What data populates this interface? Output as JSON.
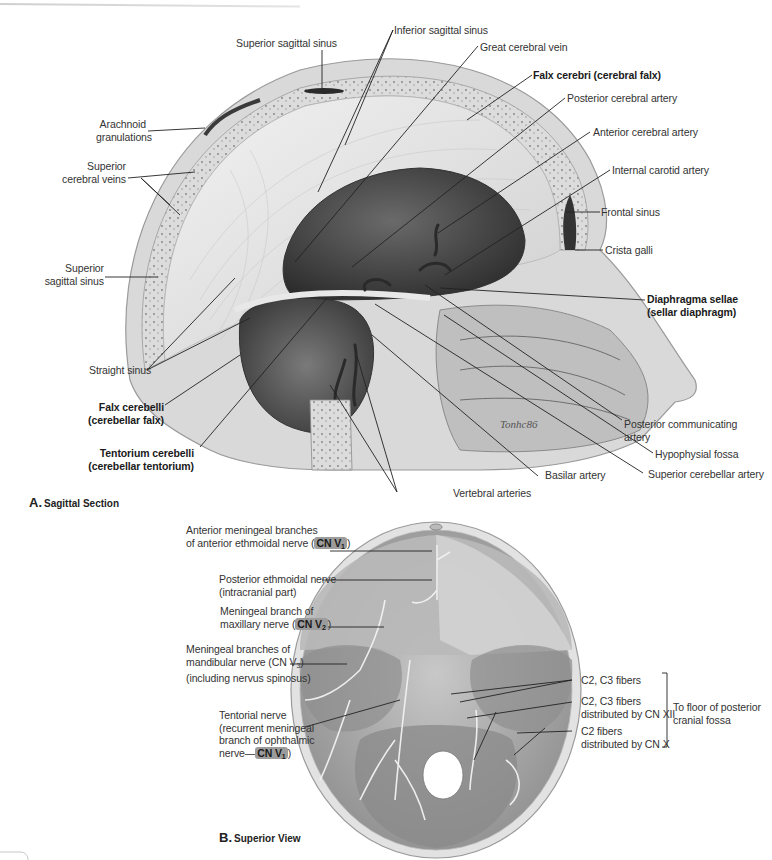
{
  "figure": {
    "panel_a": {
      "caption_letter": "A.",
      "caption_text": "Sagittal Section",
      "labels": {
        "superior_sagittal_sinus_top": "Superior sagittal sinus",
        "inferior_sagittal_sinus": "Inferior sagittal sinus",
        "great_cerebral_vein": "Great cerebral vein",
        "falx_cerebri": "Falx cerebri (cerebral falx)",
        "posterior_cerebral_artery": "Posterior cerebral artery",
        "arachnoid_granulations_1": "Arachnoid",
        "arachnoid_granulations_2": "granulations",
        "anterior_cerebral_artery": "Anterior cerebral artery",
        "superior_cerebral_veins_1": "Superior",
        "superior_cerebral_veins_2": "cerebral veins",
        "internal_carotid_artery": "Internal carotid artery",
        "frontal_sinus": "Frontal sinus",
        "crista_galli": "Crista galli",
        "superior_sagittal_sinus_left_1": "Superior",
        "superior_sagittal_sinus_left_2": "sagittal sinus",
        "diaphragma_sellae_1": "Diaphragma sellae",
        "diaphragma_sellae_2": "(sellar diaphragm)",
        "straight_sinus": "Straight sinus",
        "falx_cerebelli_1": "Falx cerebelli",
        "falx_cerebelli_2": "(cerebellar falx)",
        "posterior_communicating_artery_1": "Posterior communicating",
        "posterior_communicating_artery_2": "artery",
        "hypophysial_fossa": "Hypophysial fossa",
        "tentorium_cerebelli_1": "Tentorium cerebelli",
        "tentorium_cerebelli_2": "(cerebellar tentorium)",
        "basilar_artery": "Basilar artery",
        "superior_cerebellar_artery": "Superior cerebellar artery",
        "vertebral_arteries": "Vertebral arteries",
        "artist_signature": "Tonhc86"
      }
    },
    "panel_b": {
      "caption_letter": "B.",
      "caption_text": "Superior View",
      "labels": {
        "anterior_meningeal_1": "Anterior meningeal branches",
        "anterior_meningeal_2": "of anterior ethmoidal nerve (",
        "anterior_meningeal_badge": "CN V",
        "anterior_meningeal_badge_sub": "1",
        "anterior_meningeal_close": ")",
        "posterior_ethmoidal_1": "Posterior ethmoidal nerve",
        "posterior_ethmoidal_2": "(intracranial part)",
        "meningeal_maxillary_1": "Meningeal branch of",
        "meningeal_maxillary_2": "maxillary nerve (",
        "meningeal_maxillary_badge": "CN V",
        "meningeal_maxillary_badge_sub": "2",
        "meningeal_maxillary_close": ")",
        "meningeal_mandibular_1": "Meningeal branches of",
        "meningeal_mandibular_2": "mandibular nerve (CN V",
        "meningeal_mandibular_sub": "3",
        "meningeal_mandibular_close": ")",
        "meningeal_mandibular_3": "(including nervus spinosus)",
        "tentorial_1": "Tentorial nerve",
        "tentorial_2": "(recurrent meningeal",
        "tentorial_3": "branch of ophthalmic",
        "tentorial_4": "nerve—",
        "tentorial_badge": "CN V",
        "tentorial_badge_sub": "1",
        "tentorial_close": ")",
        "c2c3_fibers": "C2, C3 fibers",
        "c2c3_xii_1": "C2, C3  fibers",
        "c2c3_xii_2": "distributed by CN XII",
        "c2_x_1": "C2 fibers",
        "c2_x_2": "distributed by CN X",
        "bracket_1": "To floor of posterior",
        "bracket_2": "cranial fossa"
      }
    },
    "colors": {
      "badge_bg": "#9c9c9c",
      "label_text": "#333333",
      "leader_line": "#222222",
      "illustration_gray": "#8a8a8a"
    }
  }
}
